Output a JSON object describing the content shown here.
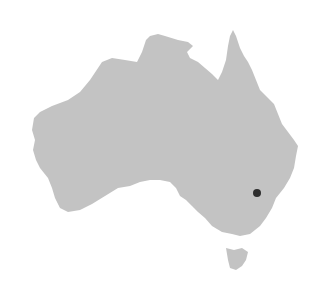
{
  "map": {
    "region": "Australia",
    "land_color": "#c3c3c3",
    "background_color": "#ffffff",
    "marker": {
      "label": "Location marker",
      "color": "#2e2e2e",
      "x": 257,
      "y": 193,
      "radius": 4
    }
  }
}
